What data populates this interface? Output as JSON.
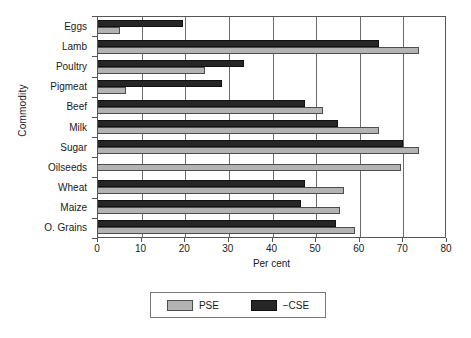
{
  "chart_data": {
    "type": "bar",
    "orientation": "horizontal",
    "title": "",
    "xlabel": "Per cent",
    "ylabel": "Commodity",
    "xlim": [
      0,
      80
    ],
    "xticks": [
      0,
      10,
      20,
      30,
      40,
      50,
      60,
      70,
      80
    ],
    "xtick_labels": [
      "0",
      "10",
      "20",
      "30",
      "40",
      "50",
      "60",
      "70",
      "80"
    ],
    "grid": true,
    "grid_axis": "x",
    "legend_position": "bottom",
    "categories": [
      "Eggs",
      "Lamb",
      "Poultry",
      "Pigmeat",
      "Beef",
      "Milk",
      "Sugar",
      "Oilseeds",
      "Wheat",
      "Maize",
      "O. Grains"
    ],
    "series": [
      {
        "name": "PSE",
        "color": "#b3b3b3",
        "values": [
          5,
          73.5,
          24.5,
          6.5,
          51.5,
          64.5,
          73.5,
          69.5,
          56.5,
          55.5,
          59
        ]
      },
      {
        "name": "−CSE",
        "color": "#262626",
        "values": [
          19.5,
          64.5,
          33.5,
          28.5,
          47.5,
          55,
          70,
          0,
          47.5,
          46.5,
          54.5
        ]
      }
    ]
  },
  "legend": {
    "items": [
      {
        "label": "PSE",
        "swatch": "pse"
      },
      {
        "label": "−CSE",
        "swatch": "cse"
      }
    ]
  },
  "axes": {
    "x_title": "Per cent",
    "y_title": "Commodity"
  }
}
